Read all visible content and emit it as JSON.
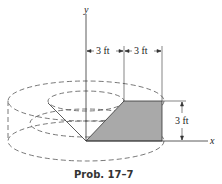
{
  "axes": {
    "y_label": "y",
    "x_label": "x"
  },
  "dimensions": {
    "inner_radius": "3 ft",
    "outer_offset": "3 ft",
    "height": "3 ft"
  },
  "caption": "Prob. 17–7",
  "colors": {
    "shaded_region": "#a9a9a9",
    "line": "#333333",
    "dashed": "#555555"
  }
}
